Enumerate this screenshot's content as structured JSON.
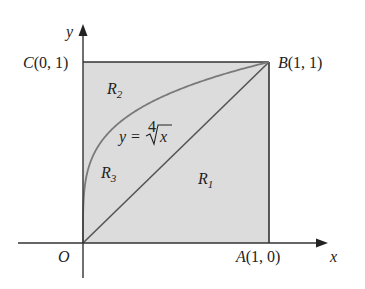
{
  "figure": {
    "axes": {
      "x_label": "x",
      "y_label": "y",
      "origin_label": "O"
    },
    "points": {
      "A": {
        "label": "A",
        "coords": "(1, 0)"
      },
      "B": {
        "label": "B",
        "coords": "(1, 1)"
      },
      "C": {
        "label": "C",
        "coords": "(0, 1)"
      }
    },
    "curve": {
      "lhs": "y",
      "eq": "=",
      "root_index": "4",
      "radicand": "x"
    },
    "regions": [
      {
        "name": "R",
        "sub": "1"
      },
      {
        "name": "R",
        "sub": "2"
      },
      {
        "name": "R",
        "sub": "3"
      }
    ],
    "colors": {
      "fill": "#dcdcdc",
      "stroke": "#333333",
      "curve": "#777777"
    }
  }
}
